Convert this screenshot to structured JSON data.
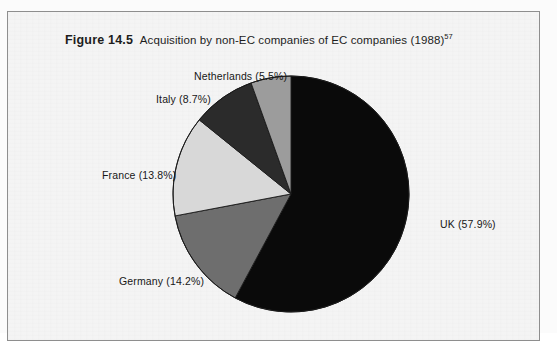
{
  "figure": {
    "number_label": "Figure 14.5",
    "caption": "Acquisition by non-EC companies of EC companies (1988)",
    "footnote_marker": "57"
  },
  "chart_data": {
    "type": "pie",
    "title": "Acquisition by non-EC companies of EC companies (1988)",
    "xlabel": "",
    "ylabel": "",
    "categories": [
      "UK",
      "Germany",
      "France",
      "Italy",
      "Netherlands"
    ],
    "values": [
      57.9,
      14.2,
      13.8,
      8.7,
      5.5
    ],
    "unit": "%",
    "start_angle_deg": 0,
    "direction": "clockwise",
    "legend": "none",
    "grid": false,
    "labels": [
      {
        "name": "UK",
        "value": 57.9,
        "text": "UK (57.9%)",
        "color": "#0a0a0a"
      },
      {
        "name": "Germany",
        "value": 14.2,
        "text": "Germany (14.2%)",
        "color": "#6e6e6e"
      },
      {
        "name": "France",
        "value": 13.8,
        "text": "France (13.8%)",
        "color": "#d8d8d8"
      },
      {
        "name": "Italy",
        "value": 8.7,
        "text": "Italy  (8.7%)",
        "color": "#2b2b2b"
      },
      {
        "name": "Netherlands",
        "value": 5.5,
        "text": "Netherlands (5.5%)",
        "color": "#9c9c9c"
      }
    ]
  },
  "colors": {
    "uk": "#0a0a0a",
    "germany": "#6e6e6e",
    "france": "#d8d8d8",
    "italy": "#2b2b2b",
    "netherlands": "#9c9c9c",
    "outline": "#1a1a1a",
    "frame": "#8e8e8e",
    "paper": "#f4f4f4"
  }
}
